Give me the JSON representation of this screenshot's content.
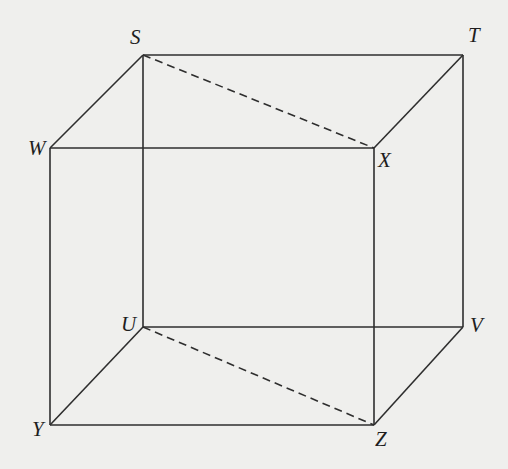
{
  "diagram": {
    "type": "rectangular-prism-wireframe",
    "background": "#efefed",
    "line_color": "#2e2e2e",
    "vertices": {
      "S": {
        "x": 143,
        "y": 55,
        "label": "S",
        "lx": 130,
        "ly": 44
      },
      "T": {
        "x": 463,
        "y": 55,
        "label": "T",
        "lx": 468,
        "ly": 42
      },
      "W": {
        "x": 50,
        "y": 148,
        "label": "W",
        "lx": 28,
        "ly": 155
      },
      "X": {
        "x": 374,
        "y": 148,
        "label": "X",
        "lx": 378,
        "ly": 167
      },
      "U": {
        "x": 143,
        "y": 327,
        "label": "U",
        "lx": 121,
        "ly": 331
      },
      "V": {
        "x": 463,
        "y": 327,
        "label": "V",
        "lx": 470,
        "ly": 332
      },
      "Y": {
        "x": 50,
        "y": 425,
        "label": "Y",
        "lx": 32,
        "ly": 436
      },
      "Z": {
        "x": 374,
        "y": 425,
        "label": "Z",
        "lx": 375,
        "ly": 446
      }
    },
    "edges": [
      {
        "from": "S",
        "to": "T",
        "style": "solid"
      },
      {
        "from": "S",
        "to": "W",
        "style": "solid"
      },
      {
        "from": "T",
        "to": "X",
        "style": "solid"
      },
      {
        "from": "W",
        "to": "X",
        "style": "solid"
      },
      {
        "from": "S",
        "to": "U",
        "style": "solid"
      },
      {
        "from": "T",
        "to": "V",
        "style": "solid"
      },
      {
        "from": "W",
        "to": "Y",
        "style": "solid"
      },
      {
        "from": "X",
        "to": "Z",
        "style": "solid"
      },
      {
        "from": "U",
        "to": "V",
        "style": "solid"
      },
      {
        "from": "U",
        "to": "Y",
        "style": "solid"
      },
      {
        "from": "V",
        "to": "Z",
        "style": "solid"
      },
      {
        "from": "Y",
        "to": "Z",
        "style": "solid"
      },
      {
        "from": "S",
        "to": "X",
        "style": "dashed"
      },
      {
        "from": "U",
        "to": "Z",
        "style": "dashed"
      }
    ],
    "labels": [
      "S",
      "T",
      "W",
      "X",
      "U",
      "V",
      "Y",
      "Z"
    ]
  }
}
